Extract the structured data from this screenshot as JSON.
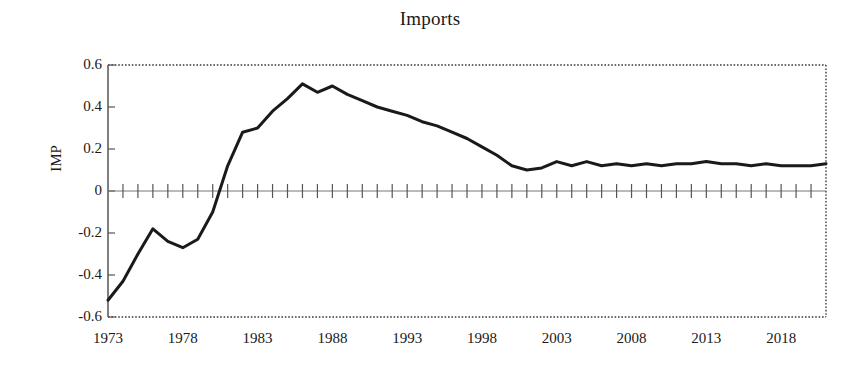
{
  "chart_data": {
    "type": "line",
    "title": "Imports",
    "xlabel": "",
    "ylabel": "IMP",
    "ylim": [
      -0.6,
      0.6
    ],
    "xlim": [
      1973,
      2021
    ],
    "grid": false,
    "legend": null,
    "y_ticks": [
      0.6,
      0.4,
      0.2,
      0,
      -0.2,
      -0.4,
      -0.6
    ],
    "y_tick_labels": [
      "0.6",
      "0.4",
      "0.2",
      "0",
      "-0.2",
      "-0.4",
      "-0.6"
    ],
    "x_ticks": [
      1973,
      1978,
      1983,
      1988,
      1993,
      1998,
      2003,
      2008,
      2013,
      2018
    ],
    "x_tick_labels": [
      "1973",
      "1978",
      "1983",
      "1988",
      "1993",
      "1998",
      "2003",
      "2008",
      "2013",
      "2018"
    ],
    "x_minor_tick_interval": 1,
    "zero_line": true,
    "frame_style": "dotted",
    "line_color": "#1a1a1a",
    "line_width": 3,
    "x": [
      1973,
      1974,
      1975,
      1976,
      1977,
      1978,
      1979,
      1980,
      1981,
      1982,
      1983,
      1984,
      1985,
      1986,
      1987,
      1988,
      1989,
      1990,
      1991,
      1992,
      1993,
      1994,
      1995,
      1996,
      1997,
      1998,
      1999,
      2000,
      2001,
      2002,
      2003,
      2004,
      2005,
      2006,
      2007,
      2008,
      2009,
      2010,
      2011,
      2012,
      2013,
      2014,
      2015,
      2016,
      2017,
      2018,
      2019,
      2020,
      2021
    ],
    "series": [
      {
        "name": "IMP",
        "values": [
          -0.52,
          -0.43,
          -0.3,
          -0.18,
          -0.24,
          -0.27,
          -0.23,
          -0.1,
          0.12,
          0.28,
          0.3,
          0.38,
          0.44,
          0.51,
          0.47,
          0.5,
          0.46,
          0.43,
          0.4,
          0.38,
          0.36,
          0.33,
          0.31,
          0.28,
          0.25,
          0.21,
          0.17,
          0.12,
          0.1,
          0.11,
          0.14,
          0.12,
          0.14,
          0.12,
          0.13,
          0.12,
          0.13,
          0.12,
          0.13,
          0.13,
          0.14,
          0.13,
          0.13,
          0.12,
          0.13,
          0.12,
          0.12,
          0.12,
          0.13
        ]
      }
    ]
  },
  "figure": {
    "background": "#ffffff",
    "axis_color": "#555555",
    "text_color": "#1a1a1a"
  }
}
